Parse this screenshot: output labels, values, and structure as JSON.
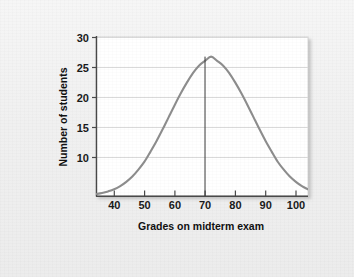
{
  "figure": {
    "background_color": "#f1f1f1",
    "plot_background_color": "#ffffff"
  },
  "chart_data": {
    "type": "line",
    "title": "",
    "subtitle": "",
    "xlabel": "Grades on midterm exam",
    "ylabel": "Number of students",
    "xlim": [
      34,
      104
    ],
    "ylim": [
      0,
      30
    ],
    "xticks": [
      40,
      50,
      60,
      70,
      80,
      90,
      100
    ],
    "xtick_labels": [
      "40",
      "50",
      "60",
      "70",
      "80",
      "90",
      "100"
    ],
    "yticks": [
      10,
      15,
      20,
      25,
      30
    ],
    "ytick_labels": [
      "10",
      "15",
      "20",
      "25",
      "30"
    ],
    "grid": "horizontal",
    "legend": "none",
    "curve_color": "#8d8d8d",
    "gridline_color": "#d8d8d8",
    "axis_color": "#4a4a4a",
    "mean_line_color": "#3a3a3a",
    "annotations": [
      {
        "name": "mean-line",
        "type": "vertical-line",
        "x": 70,
        "y_top": 26.3,
        "y_bottom": 0,
        "label": ""
      }
    ],
    "series": [
      {
        "name": "Normal distribution of midterm grades",
        "distribution": "normal",
        "mean": 70,
        "std_dev": 10,
        "peak_value": 26.3,
        "x": [
          34,
          36,
          38,
          40,
          42,
          44,
          46,
          48,
          50,
          52,
          54,
          56,
          58,
          60,
          62,
          64,
          66,
          68,
          70,
          72,
          74,
          76,
          78,
          80,
          82,
          84,
          86,
          88,
          90,
          92,
          94,
          96,
          98,
          100,
          102,
          104
        ],
        "values": [
          0.4,
          0.6,
          0.9,
          1.3,
          1.9,
          2.7,
          3.7,
          5.0,
          6.5,
          8.4,
          10.4,
          12.6,
          14.9,
          17.2,
          19.4,
          21.4,
          23.2,
          24.6,
          25.5,
          26.3,
          25.5,
          24.6,
          23.2,
          21.4,
          19.4,
          17.2,
          14.9,
          12.6,
          10.4,
          8.4,
          6.5,
          5.0,
          3.7,
          2.7,
          1.9,
          1.3
        ]
      }
    ]
  }
}
